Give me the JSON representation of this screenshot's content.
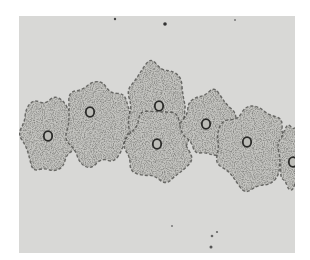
{
  "image": {
    "subject": "micrograph-squamous-epithelial-cells",
    "colors": {
      "background": "#ffffff",
      "field": "#d8d8d6",
      "cell": "#c4c4c0",
      "stain": "#3a3a38",
      "nucleus": "#2a2a28"
    },
    "cells": [
      {
        "cx": 30,
        "cy": 118,
        "rx": 32,
        "ry": 42,
        "nx": 29,
        "ny": 120
      },
      {
        "cx": 78,
        "cy": 108,
        "rx": 36,
        "ry": 48,
        "nx": 71,
        "ny": 96
      },
      {
        "cx": 138,
        "cy": 90,
        "rx": 34,
        "ry": 48,
        "nx": 140,
        "ny": 90
      },
      {
        "cx": 140,
        "cy": 130,
        "rx": 38,
        "ry": 40,
        "nx": 138,
        "ny": 128
      },
      {
        "cx": 190,
        "cy": 108,
        "rx": 30,
        "ry": 36,
        "nx": 187,
        "ny": 108
      },
      {
        "cx": 233,
        "cy": 132,
        "rx": 40,
        "ry": 46,
        "nx": 228,
        "ny": 126
      },
      {
        "cx": 272,
        "cy": 140,
        "rx": 14,
        "ry": 36,
        "nx": 274,
        "ny": 146
      }
    ]
  }
}
